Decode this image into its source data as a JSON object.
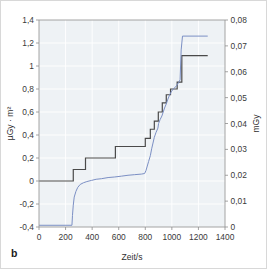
{
  "figure": {
    "panel_label": "b",
    "background_color": "#eef2f5",
    "border_color": "#d8d8d8"
  },
  "chart_data": {
    "type": "line",
    "title": "",
    "subtitle": "",
    "xlabel": "Zeit/s",
    "ylabel": "µGy · m²",
    "y2label": "mGy",
    "xlim": [
      0,
      1400
    ],
    "ylim": [
      -0.4,
      1.4
    ],
    "y2lim": [
      0,
      0.08
    ],
    "grid": true,
    "legend": "none",
    "xticks": [
      0,
      200,
      400,
      600,
      800,
      1000,
      1200,
      1400
    ],
    "xticklabels": [
      "0",
      "200",
      "400",
      "600",
      "800",
      "1000",
      "1200",
      "1400"
    ],
    "yticks": [
      -0.4,
      -0.2,
      0,
      0.2,
      0.4,
      0.6,
      0.8,
      1.0,
      1.2,
      1.4
    ],
    "yticklabels": [
      "-0,4",
      "-0,2",
      "0",
      "0,2",
      "0,4",
      "0,6",
      "0,8",
      "1",
      "1,2",
      "1,4"
    ],
    "y2ticks": [
      0,
      0.01,
      0.02,
      0.03,
      0.04,
      0.05,
      0.06,
      0.07,
      0.08
    ],
    "y2ticklabels": [
      "0",
      "0,01",
      "0,02",
      "0,03",
      "0,04",
      "0,05",
      "0,06",
      "0,07",
      "0,08"
    ],
    "series": [
      {
        "name": "dose-area-product-steps",
        "color": "#4a4a4a",
        "axis": "left",
        "style": "step",
        "points": [
          [
            0,
            0.0
          ],
          [
            258,
            0.0
          ],
          [
            258,
            0.1
          ],
          [
            350,
            0.1
          ],
          [
            350,
            0.2
          ],
          [
            575,
            0.2
          ],
          [
            575,
            0.3
          ],
          [
            800,
            0.3
          ],
          [
            800,
            0.37
          ],
          [
            838,
            0.37
          ],
          [
            838,
            0.45
          ],
          [
            868,
            0.45
          ],
          [
            868,
            0.52
          ],
          [
            898,
            0.52
          ],
          [
            898,
            0.6
          ],
          [
            928,
            0.6
          ],
          [
            928,
            0.68
          ],
          [
            958,
            0.68
          ],
          [
            958,
            0.75
          ],
          [
            990,
            0.75
          ],
          [
            990,
            0.8
          ],
          [
            1040,
            0.8
          ],
          [
            1040,
            0.86
          ],
          [
            1075,
            0.86
          ],
          [
            1075,
            1.09
          ],
          [
            1270,
            1.09
          ]
        ]
      },
      {
        "name": "dose-steps",
        "color": "#7b8fc4",
        "axis": "right",
        "style": "step",
        "points": [
          [
            0,
            -0.385
          ],
          [
            248,
            -0.385
          ],
          [
            252,
            -0.3
          ],
          [
            258,
            -0.21
          ],
          [
            265,
            -0.14
          ],
          [
            278,
            -0.09
          ],
          [
            292,
            -0.055
          ],
          [
            310,
            -0.03
          ],
          [
            335,
            -0.015
          ],
          [
            360,
            -0.005
          ],
          [
            395,
            0.005
          ],
          [
            430,
            0.015
          ],
          [
            470,
            0.02
          ],
          [
            520,
            0.03
          ],
          [
            570,
            0.035
          ],
          [
            620,
            0.042
          ],
          [
            670,
            0.05
          ],
          [
            720,
            0.055
          ],
          [
            770,
            0.06
          ],
          [
            795,
            0.065
          ],
          [
            805,
            0.09
          ],
          [
            815,
            0.13
          ],
          [
            825,
            0.17
          ],
          [
            838,
            0.22
          ],
          [
            848,
            0.28
          ],
          [
            858,
            0.33
          ],
          [
            868,
            0.38
          ],
          [
            880,
            0.42
          ],
          [
            895,
            0.46
          ],
          [
            900,
            0.5
          ],
          [
            912,
            0.535
          ],
          [
            925,
            0.565
          ],
          [
            935,
            0.6
          ],
          [
            945,
            0.635
          ],
          [
            958,
            0.67
          ],
          [
            968,
            0.705
          ],
          [
            980,
            0.74
          ],
          [
            995,
            0.775
          ],
          [
            1010,
            0.8
          ],
          [
            1030,
            0.82
          ],
          [
            1050,
            0.855
          ],
          [
            1062,
            0.88
          ],
          [
            1070,
            1.14
          ],
          [
            1080,
            1.26
          ],
          [
            1270,
            1.26
          ]
        ]
      }
    ]
  }
}
